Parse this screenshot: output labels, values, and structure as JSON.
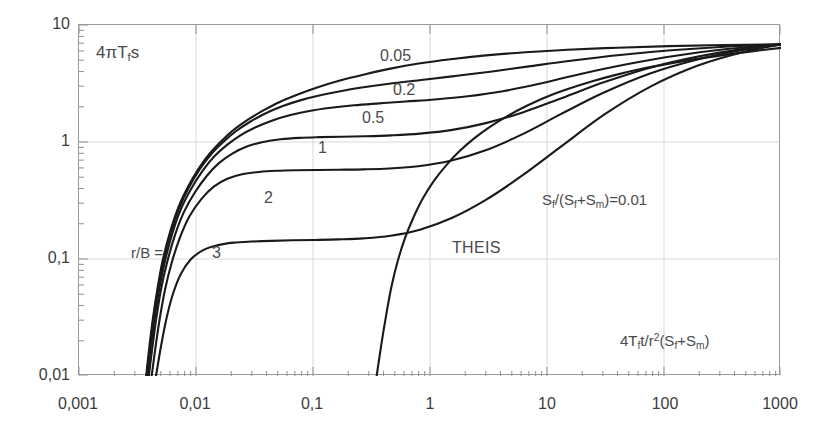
{
  "chart_data": {
    "type": "line",
    "title": "",
    "xlabel": "4Tft/r²(Sf+Sₘ)",
    "ylabel": "4πTfs",
    "xscale": "log",
    "yscale": "log",
    "xlim": [
      0.001,
      1000
    ],
    "ylim": [
      0.01,
      10
    ],
    "grid": true,
    "legend_position": "inline-curve-labels",
    "xticklabels": [
      "0,001",
      "0,01",
      "0,1",
      "1",
      "10",
      "100",
      "1000"
    ],
    "xtickvalues": [
      0.001,
      0.01,
      0.1,
      1,
      10,
      100,
      1000
    ],
    "yticklabels": [
      "10",
      "1",
      "0,1",
      "0,01"
    ],
    "ytickvalues": [
      10,
      1,
      0.1,
      0.01
    ],
    "annotations": [
      {
        "name": "y-axis-title",
        "text": "4πTfs",
        "x": 0.0017,
        "y": 5.6
      },
      {
        "name": "x-axis-title",
        "text": "4Tft/r²(Sf+Sₘ)",
        "x": 60,
        "y": 0.026
      },
      {
        "name": "parameter-note",
        "text": "Sf/(Sf+Sₘ)=0.01",
        "x": 6.0,
        "y": 0.3
      },
      {
        "name": "theis-label",
        "text": "THEIS",
        "x": 1.1,
        "y": 0.115
      },
      {
        "name": "rb-label",
        "text": "r/B =",
        "x": 0.0055,
        "y": 0.098
      }
    ],
    "series": [
      {
        "name": "r/B = 0.05",
        "label": "0.05",
        "label_x": 0.17,
        "label_y": 4.25,
        "points": [
          [
            0.00375,
            0.01
          ],
          [
            0.004,
            0.018
          ],
          [
            0.0043,
            0.032
          ],
          [
            0.0047,
            0.057
          ],
          [
            0.0052,
            0.098
          ],
          [
            0.006,
            0.17
          ],
          [
            0.007,
            0.27
          ],
          [
            0.0085,
            0.41
          ],
          [
            0.0105,
            0.59
          ],
          [
            0.013,
            0.79
          ],
          [
            0.0165,
            1.02
          ],
          [
            0.021,
            1.27
          ],
          [
            0.028,
            1.56
          ],
          [
            0.038,
            1.87
          ],
          [
            0.052,
            2.2
          ],
          [
            0.075,
            2.56
          ],
          [
            0.11,
            2.94
          ],
          [
            0.17,
            3.36
          ],
          [
            0.28,
            3.8
          ],
          [
            0.46,
            4.24
          ],
          [
            0.8,
            4.68
          ],
          [
            1.5,
            5.1
          ],
          [
            3.0,
            5.5
          ],
          [
            6.5,
            5.85
          ],
          [
            15.0,
            6.15
          ],
          [
            40.0,
            6.4
          ],
          [
            110.0,
            6.6
          ],
          [
            320.0,
            6.74
          ],
          [
            1000.0,
            6.83
          ]
        ]
      },
      {
        "name": "r/B = 0.2",
        "label": "0.2",
        "label_x": 0.215,
        "label_y": 2.72,
        "points": [
          [
            0.00378,
            0.01
          ],
          [
            0.00405,
            0.018
          ],
          [
            0.00435,
            0.032
          ],
          [
            0.00475,
            0.057
          ],
          [
            0.0053,
            0.098
          ],
          [
            0.0061,
            0.17
          ],
          [
            0.00715,
            0.27
          ],
          [
            0.00865,
            0.405
          ],
          [
            0.0107,
            0.58
          ],
          [
            0.0133,
            0.775
          ],
          [
            0.017,
            0.995
          ],
          [
            0.0218,
            1.23
          ],
          [
            0.029,
            1.49
          ],
          [
            0.0395,
            1.76
          ],
          [
            0.0545,
            2.02
          ],
          [
            0.079,
            2.28
          ],
          [
            0.118,
            2.52
          ],
          [
            0.185,
            2.76
          ],
          [
            0.3,
            2.98
          ],
          [
            0.5,
            3.19
          ],
          [
            0.88,
            3.4
          ],
          [
            1.7,
            3.68
          ],
          [
            3.4,
            4.01
          ],
          [
            7.0,
            4.43
          ],
          [
            16.0,
            4.95
          ],
          [
            42.0,
            5.54
          ],
          [
            115.0,
            6.08
          ],
          [
            330.0,
            6.52
          ],
          [
            1000.0,
            6.83
          ]
        ]
      },
      {
        "name": "r/B = 0.5",
        "label": "0.5",
        "label_x": 0.105,
        "label_y": 1.9,
        "points": [
          [
            0.00385,
            0.01
          ],
          [
            0.00412,
            0.018
          ],
          [
            0.00445,
            0.032
          ],
          [
            0.00488,
            0.057
          ],
          [
            0.00545,
            0.0975
          ],
          [
            0.0063,
            0.168
          ],
          [
            0.0074,
            0.265
          ],
          [
            0.00905,
            0.395
          ],
          [
            0.0113,
            0.56
          ],
          [
            0.0141,
            0.74
          ],
          [
            0.0182,
            0.935
          ],
          [
            0.0236,
            1.13
          ],
          [
            0.032,
            1.33
          ],
          [
            0.0445,
            1.52
          ],
          [
            0.063,
            1.69
          ],
          [
            0.093,
            1.84
          ],
          [
            0.142,
            1.96
          ],
          [
            0.225,
            2.06
          ],
          [
            0.37,
            2.14
          ],
          [
            0.62,
            2.22
          ],
          [
            1.1,
            2.31
          ],
          [
            2.1,
            2.46
          ],
          [
            4.2,
            2.72
          ],
          [
            8.8,
            3.16
          ],
          [
            19.0,
            3.8
          ],
          [
            48.0,
            4.62
          ],
          [
            130.0,
            5.49
          ],
          [
            360.0,
            6.26
          ],
          [
            1000.0,
            6.83
          ]
        ]
      },
      {
        "name": "r/B = 1",
        "label": "1",
        "label_x": 0.063,
        "label_y": 1.09,
        "points": [
          [
            0.00395,
            0.01
          ],
          [
            0.00425,
            0.018
          ],
          [
            0.0046,
            0.032
          ],
          [
            0.00505,
            0.0565
          ],
          [
            0.0057,
            0.096
          ],
          [
            0.00665,
            0.163
          ],
          [
            0.0079,
            0.253
          ],
          [
            0.0098,
            0.372
          ],
          [
            0.0124,
            0.515
          ],
          [
            0.0157,
            0.66
          ],
          [
            0.0206,
            0.8
          ],
          [
            0.0272,
            0.915
          ],
          [
            0.0375,
            1.0
          ],
          [
            0.053,
            1.055
          ],
          [
            0.076,
            1.085
          ],
          [
            0.113,
            1.1
          ],
          [
            0.175,
            1.11
          ],
          [
            0.28,
            1.12
          ],
          [
            0.47,
            1.14
          ],
          [
            0.82,
            1.18
          ],
          [
            1.55,
            1.27
          ],
          [
            3.0,
            1.45
          ],
          [
            6.2,
            1.79
          ],
          [
            13.5,
            2.38
          ],
          [
            31.0,
            3.25
          ],
          [
            80.0,
            4.38
          ],
          [
            200.0,
            5.4
          ],
          [
            480.0,
            6.25
          ],
          [
            1000.0,
            6.83
          ]
        ]
      },
      {
        "name": "r/B = 2",
        "label": "2",
        "label_x": 0.0295,
        "label_y": 0.385,
        "points": [
          [
            0.00418,
            0.01
          ],
          [
            0.00452,
            0.018
          ],
          [
            0.00492,
            0.0318
          ],
          [
            0.00545,
            0.0555
          ],
          [
            0.0062,
            0.093
          ],
          [
            0.0073,
            0.153
          ],
          [
            0.0088,
            0.232
          ],
          [
            0.0111,
            0.325
          ],
          [
            0.0142,
            0.415
          ],
          [
            0.0185,
            0.485
          ],
          [
            0.0248,
            0.53
          ],
          [
            0.0345,
            0.555
          ],
          [
            0.049,
            0.568
          ],
          [
            0.072,
            0.574
          ],
          [
            0.108,
            0.577
          ],
          [
            0.168,
            0.58
          ],
          [
            0.27,
            0.584
          ],
          [
            0.45,
            0.594
          ],
          [
            0.79,
            0.62
          ],
          [
            1.5,
            0.69
          ],
          [
            2.9,
            0.84
          ],
          [
            6.0,
            1.15
          ],
          [
            13.0,
            1.72
          ],
          [
            30.0,
            2.62
          ],
          [
            76.0,
            3.85
          ],
          [
            190.0,
            5.05
          ],
          [
            460.0,
            6.08
          ],
          [
            1000.0,
            6.83
          ]
        ]
      },
      {
        "name": "r/B = 3",
        "label": "3",
        "label_x": 0.0138,
        "label_y": 0.098,
        "points": [
          [
            0.00455,
            0.01
          ],
          [
            0.005,
            0.0175
          ],
          [
            0.00555,
            0.03
          ],
          [
            0.0063,
            0.049
          ],
          [
            0.0074,
            0.074
          ],
          [
            0.009,
            0.099
          ],
          [
            0.0115,
            0.119
          ],
          [
            0.0152,
            0.131
          ],
          [
            0.021,
            0.138
          ],
          [
            0.03,
            0.141
          ],
          [
            0.044,
            0.143
          ],
          [
            0.067,
            0.1445
          ],
          [
            0.104,
            0.1455
          ],
          [
            0.165,
            0.147
          ],
          [
            0.27,
            0.15
          ],
          [
            0.46,
            0.158
          ],
          [
            0.82,
            0.178
          ],
          [
            1.55,
            0.225
          ],
          [
            3.0,
            0.32
          ],
          [
            6.2,
            0.52
          ],
          [
            13.5,
            0.93
          ],
          [
            31.0,
            1.72
          ],
          [
            78.0,
            3.0
          ],
          [
            195.0,
            4.5
          ],
          [
            470.0,
            5.85
          ],
          [
            1000.0,
            6.83
          ]
        ]
      },
      {
        "name": "THEIS",
        "label": "THEIS",
        "label_x": 1.1,
        "label_y": 0.115,
        "points": [
          [
            0.35,
            0.01
          ],
          [
            0.385,
            0.019
          ],
          [
            0.425,
            0.0345
          ],
          [
            0.47,
            0.059
          ],
          [
            0.53,
            0.096
          ],
          [
            0.61,
            0.15
          ],
          [
            0.72,
            0.225
          ],
          [
            0.87,
            0.33
          ],
          [
            1.08,
            0.465
          ],
          [
            1.38,
            0.635
          ],
          [
            1.8,
            0.84
          ],
          [
            2.4,
            1.08
          ],
          [
            3.3,
            1.36
          ],
          [
            4.7,
            1.69
          ],
          [
            6.8,
            2.05
          ],
          [
            10.0,
            2.44
          ],
          [
            15.5,
            2.86
          ],
          [
            24.0,
            3.29
          ],
          [
            38.0,
            3.73
          ],
          [
            62.0,
            4.18
          ],
          [
            105.0,
            4.63
          ],
          [
            180.0,
            5.08
          ],
          [
            320.0,
            5.53
          ],
          [
            580.0,
            5.98
          ],
          [
            1000.0,
            6.38
          ]
        ]
      }
    ]
  },
  "style": {
    "curve_color": "#1a1a1a",
    "grid_color": "#d9d9d9",
    "axis_color": "#8f8f8f",
    "text_color": "#3c3c3c",
    "background": "#ffffff"
  }
}
